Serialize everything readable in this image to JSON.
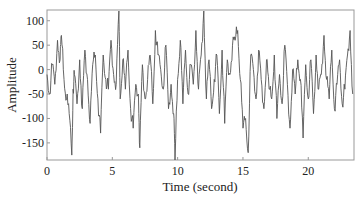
{
  "chart_data": {
    "type": "line",
    "title": "",
    "xlabel": "Time (second)",
    "ylabel": "Amplitude",
    "xlim": [
      0,
      23.5
    ],
    "ylim": [
      -185,
      122
    ],
    "xticks": [
      0,
      5,
      10,
      15,
      20
    ],
    "yticks": [
      100,
      50,
      0,
      -50,
      -100,
      -150
    ],
    "grid": false,
    "legend": null,
    "line_color": "#555555",
    "series": [
      {
        "name": "signal",
        "x": [
          0.0,
          0.2,
          0.4,
          0.6,
          0.8,
          1.0,
          1.1,
          1.3,
          1.5,
          1.7,
          1.9,
          2.0,
          2.1,
          2.3,
          2.5,
          2.7,
          2.9,
          3.1,
          3.3,
          3.5,
          3.7,
          3.9,
          4.1,
          4.3,
          4.5,
          4.7,
          4.9,
          5.1,
          5.3,
          5.5,
          5.6,
          5.8,
          6.0,
          6.2,
          6.4,
          6.6,
          6.8,
          7.0,
          7.1,
          7.3,
          7.5,
          7.7,
          7.9,
          8.1,
          8.3,
          8.5,
          8.7,
          8.9,
          9.1,
          9.3,
          9.5,
          9.7,
          9.8,
          10.0,
          10.2,
          10.4,
          10.6,
          10.8,
          11.0,
          11.2,
          11.4,
          11.6,
          11.8,
          12.0,
          12.2,
          12.4,
          12.6,
          12.8,
          13.0,
          13.2,
          13.4,
          13.6,
          13.8,
          14.0,
          14.2,
          14.4,
          14.6,
          14.8,
          15.0,
          15.2,
          15.4,
          15.6,
          15.8,
          16.0,
          16.2,
          16.4,
          16.6,
          16.8,
          17.0,
          17.2,
          17.4,
          17.6,
          17.8,
          18.0,
          18.2,
          18.4,
          18.6,
          18.8,
          19.0,
          19.2,
          19.4,
          19.6,
          19.8,
          20.0,
          20.2,
          20.4,
          20.6,
          20.8,
          21.0,
          21.2,
          21.4,
          21.6,
          21.8,
          22.0,
          22.2,
          22.4,
          22.6,
          22.8,
          23.0,
          23.2,
          23.4
        ],
        "values": [
          -10,
          -50,
          10,
          -30,
          60,
          20,
          70,
          -20,
          -60,
          -90,
          -175,
          -40,
          -10,
          -70,
          20,
          -80,
          40,
          -20,
          -110,
          10,
          30,
          -60,
          -130,
          30,
          -20,
          -40,
          60,
          -10,
          -30,
          120,
          -60,
          20,
          -40,
          40,
          -80,
          -120,
          -30,
          -50,
          -160,
          10,
          -60,
          -20,
          30,
          -70,
          80,
          30,
          0,
          -40,
          50,
          -80,
          -30,
          -90,
          -185,
          -20,
          60,
          -70,
          40,
          -50,
          10,
          -30,
          80,
          -40,
          30,
          120,
          -60,
          20,
          -80,
          -20,
          30,
          -90,
          40,
          -110,
          20,
          -10,
          50,
          60,
          80,
          -20,
          -120,
          -100,
          -170,
          30,
          0,
          -60,
          40,
          -20,
          -80,
          20,
          -40,
          -60,
          30,
          -100,
          -10,
          -70,
          50,
          -30,
          -120,
          0,
          -50,
          20,
          -20,
          -140,
          10,
          -60,
          20,
          -90,
          30,
          -40,
          -10,
          70,
          -20,
          -60,
          40,
          -80,
          -30,
          20,
          -70,
          -40,
          30,
          80,
          -50
        ]
      }
    ]
  }
}
